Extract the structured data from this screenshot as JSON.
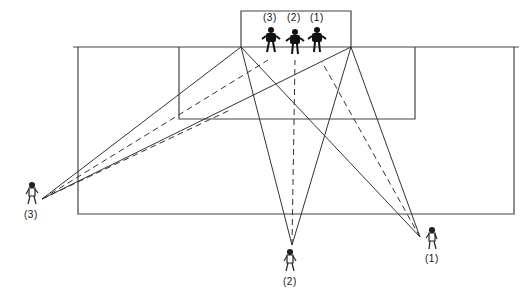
{
  "diagram": {
    "goal_keepers": [
      {
        "label": "(3)",
        "x": 271,
        "y": 30
      },
      {
        "label": "(2)",
        "x": 295,
        "y": 32
      },
      {
        "label": "(1)",
        "x": 317,
        "y": 30
      }
    ],
    "attackers": [
      {
        "label": "(3)",
        "x": 33,
        "y": 196
      },
      {
        "label": "(2)",
        "x": 290,
        "y": 262
      },
      {
        "label": "(1)",
        "x": 432,
        "y": 240
      }
    ],
    "colors": {
      "line": "#333333",
      "background": "#ffffff"
    }
  }
}
